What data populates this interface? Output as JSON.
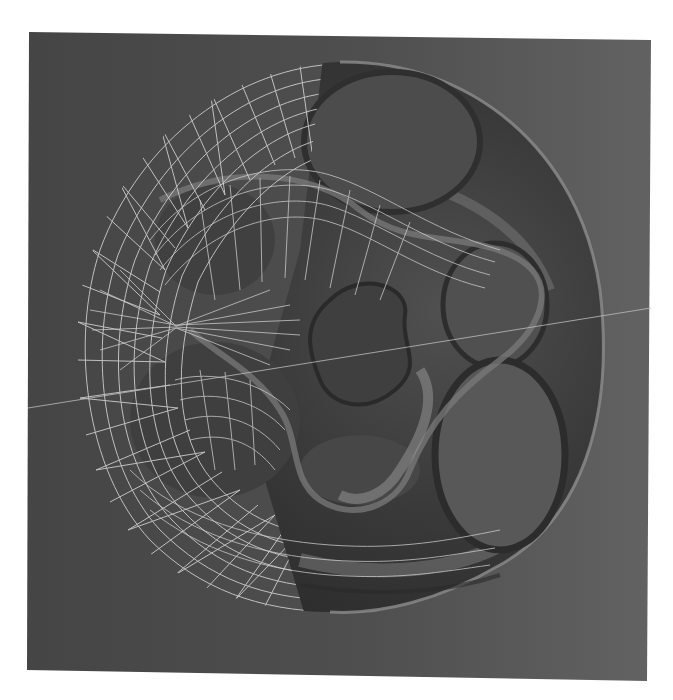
{
  "scene": {
    "description": "3D rendering of a minimal surface, left half shown as white wireframe mesh, right half shown as smooth shaded surface, on a dark gray viewport",
    "viewport": {
      "corners": {
        "top_left": [
          29,
          32
        ],
        "top_right": [
          651,
          40
        ],
        "bottom_right": [
          647,
          681
        ],
        "bottom_left": [
          27,
          670
        ]
      },
      "color_dark": "#474747",
      "color_light": "#5f5f5f"
    },
    "surface": {
      "wire_color": "#d8d8d8",
      "shade_dark": "#2f2f2f",
      "shade_mid": "#4a4a4a",
      "shade_light": "#8a8a8a",
      "hole_count": 4,
      "center_hole": "tri-lobed"
    },
    "axis_line": {
      "from": [
        28,
        408
      ],
      "to": [
        651,
        308
      ],
      "color": "#bdbdbd"
    },
    "background": "#ffffff"
  }
}
